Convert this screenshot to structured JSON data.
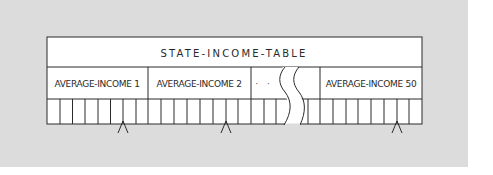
{
  "diagram": {
    "title": "STATE-INCOME-TABLE",
    "fields": [
      {
        "label": "AVERAGE-INCOME 1"
      },
      {
        "label": "AVERAGE-INCOME 2"
      },
      {
        "label": "· · ·"
      },
      {
        "label": "AVERAGE-INCOME 50"
      }
    ],
    "cells_per_field": 8,
    "markers": [
      "caret",
      "caret",
      "caret"
    ],
    "colors": {
      "background": "#dcdcdc",
      "box_fill": "#ffffff",
      "stroke": "#2a2a2a"
    }
  }
}
